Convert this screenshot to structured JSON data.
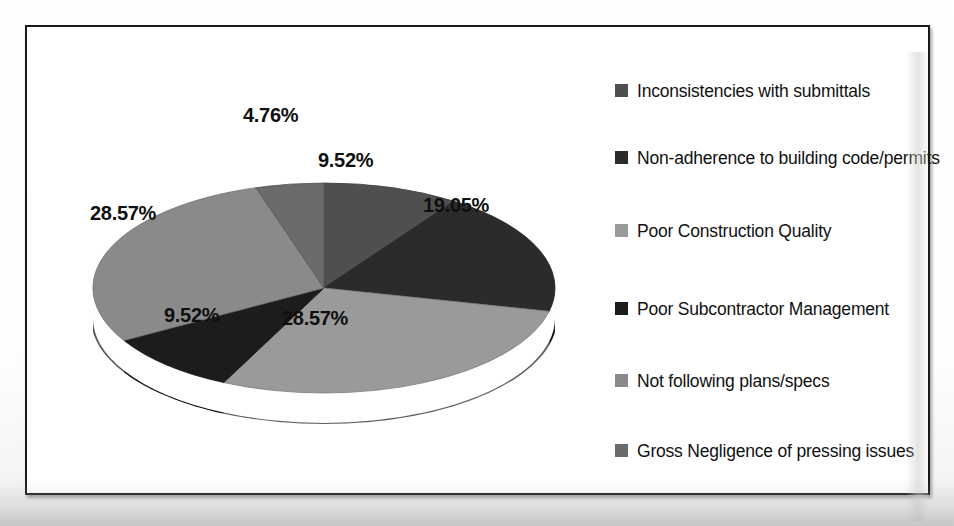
{
  "chart_data": {
    "type": "pie",
    "title": "",
    "legend_position": "right",
    "three_d": true,
    "categories": [
      "Inconsistencies with submittals",
      "Non-adherence to building code/permits",
      "Poor Construction Quality",
      "Poor Subcontractor Management",
      "Not following plans/specs",
      "Gross Negligence of pressing issues"
    ],
    "values": [
      9.52,
      19.05,
      28.57,
      9.52,
      28.57,
      4.76
    ],
    "value_labels": [
      "9.52%",
      "19.05%",
      "28.57%",
      "9.52%",
      "28.57%",
      "4.76%"
    ],
    "colors": [
      "#4f4f4f",
      "#2b2b2b",
      "#9a9a9a",
      "#1c1c1c",
      "#8a8a8a",
      "#6b6b6b"
    ],
    "units": "percent",
    "total": 100.0
  },
  "legend": {
    "items": [
      {
        "label": "Inconsistencies with submittals",
        "color": "#4f4f4f"
      },
      {
        "label": "Non-adherence to building code/permits",
        "color": "#2b2b2b"
      },
      {
        "label": "Poor Construction Quality",
        "color": "#9a9a9a"
      },
      {
        "label": "Poor Subcontractor Management",
        "color": "#1c1c1c"
      },
      {
        "label": "Not following plans/specs",
        "color": "#8a8a8a"
      },
      {
        "label": "Gross Negligence of pressing issues",
        "color": "#6b6b6b"
      }
    ]
  },
  "slice_labels": {
    "top_sliver": "4.76%",
    "top_right": "9.52%",
    "right": "19.05%",
    "bottom": "28.57%",
    "bottom_left": "9.52%",
    "left": "28.57%"
  },
  "style": {
    "frame_color": "#1a1a1a",
    "background": "#ffffff"
  }
}
